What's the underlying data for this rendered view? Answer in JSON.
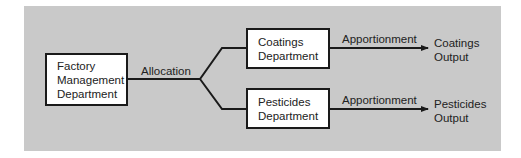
{
  "diagram": {
    "source": {
      "lines": [
        "Factory",
        "Management",
        "Department"
      ]
    },
    "edge_label": "Allocation",
    "departments": [
      {
        "lines": [
          "Coatings",
          "Department"
        ],
        "edge_label": "Apportionment",
        "output": [
          "Coatings",
          "Output"
        ]
      },
      {
        "lines": [
          "Pesticides",
          "Department"
        ],
        "edge_label": "Apportionment",
        "output": [
          "Pesticides",
          "Output"
        ]
      }
    ],
    "colors": {
      "panel": "#c9c9c9",
      "box_fill": "#ffffff",
      "stroke": "#1a1a1a"
    }
  }
}
